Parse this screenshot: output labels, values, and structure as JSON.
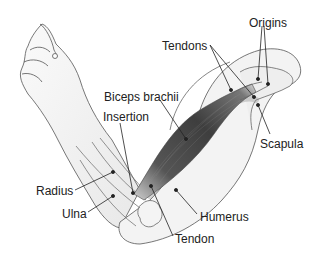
{
  "diagram": {
    "type": "anatomical-illustration",
    "labels": [
      {
        "id": "origins",
        "text": "Origins",
        "x": 249,
        "y": 17
      },
      {
        "id": "tendons",
        "text": "Tendons",
        "x": 162,
        "y": 40
      },
      {
        "id": "biceps",
        "text": "Biceps brachii",
        "x": 104,
        "y": 91
      },
      {
        "id": "insertion",
        "text": "Insertion",
        "x": 103,
        "y": 111
      },
      {
        "id": "scapula",
        "text": "Scapula",
        "x": 260,
        "y": 138
      },
      {
        "id": "radius",
        "text": "Radius",
        "x": 36,
        "y": 185
      },
      {
        "id": "ulna",
        "text": "Ulna",
        "x": 62,
        "y": 208
      },
      {
        "id": "humerus",
        "text": "Humerus",
        "x": 200,
        "y": 211
      },
      {
        "id": "tendon",
        "text": "Tendon",
        "x": 175,
        "y": 233
      }
    ]
  }
}
